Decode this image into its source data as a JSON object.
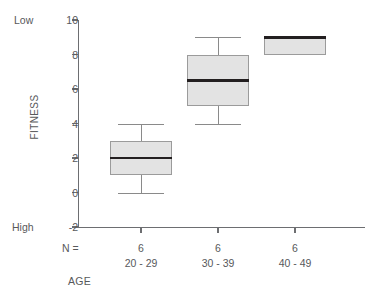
{
  "chart_data": {
    "type": "box",
    "title": "",
    "xlabel": "AGE",
    "ylabel": "FITNESS",
    "ylim": [
      -2,
      10
    ],
    "yticks": [
      10,
      8,
      6,
      4,
      2,
      0,
      -2
    ],
    "ytick_labels": [
      "10",
      "8",
      "6",
      "4",
      "2",
      "0",
      "-2"
    ],
    "grid": false,
    "legend": false,
    "axis_endpoint_labels": {
      "top": "Low",
      "bottom": "High"
    },
    "n_row_label": "N =",
    "categories": [
      "20 - 29",
      "30 - 39",
      "40 - 49"
    ],
    "counts": [
      "6",
      "6",
      "6"
    ],
    "boxes": [
      {
        "category": "20 - 29",
        "n": 6,
        "whisker_low": 0,
        "q1": 1,
        "median": 2,
        "q3": 3,
        "whisker_high": 4
      },
      {
        "category": "30 - 39",
        "n": 6,
        "whisker_low": 4,
        "q1": 5,
        "median": 6.5,
        "q3": 8,
        "whisker_high": 9
      },
      {
        "category": "40 - 49",
        "n": 6,
        "whisker_low": 8,
        "q1": 8,
        "median": 9,
        "q3": 9,
        "whisker_high": 9
      }
    ],
    "colors": {
      "box_fill": "#e3e3e3",
      "box_edge": "#9b9b9b",
      "median": "#231f20",
      "whisker": "#8a8a8a",
      "axis": "#6d6e71",
      "text": "#58595b"
    }
  }
}
